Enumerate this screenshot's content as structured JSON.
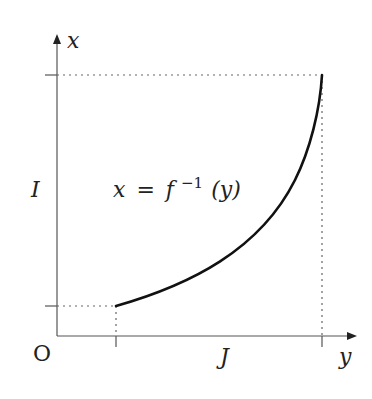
{
  "diagram": {
    "type": "function-graph",
    "axes": {
      "x_axis_label": "y",
      "y_axis_label": "x",
      "origin_label": "O"
    },
    "intervals": {
      "vertical_label": "I",
      "horizontal_label": "J"
    },
    "curve": {
      "label_lhs": "x",
      "label_eq": "=",
      "label_func": "f",
      "label_sup": "−1",
      "label_arg": "(y)",
      "description": "increasing convex curve of the inverse function"
    },
    "colors": {
      "axis": "#555555",
      "curve": "#111111",
      "guides": "#666666",
      "text": "#222222"
    }
  }
}
